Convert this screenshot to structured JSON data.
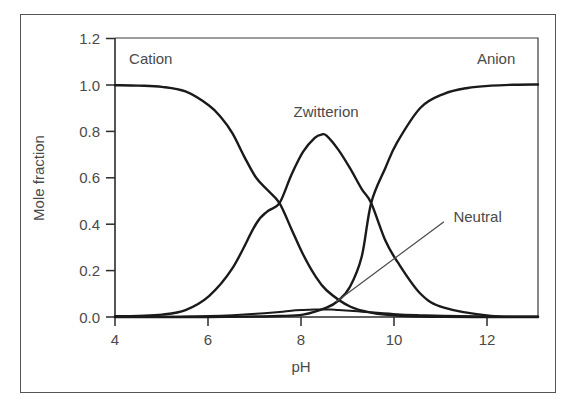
{
  "figure": {
    "background_color": "#ffffff",
    "border_color": "#555555",
    "curve_color": "#1a1a1a",
    "text_color": "#4a4a4a"
  },
  "chart_data": {
    "type": "line",
    "title": "",
    "xlabel": "pH",
    "ylabel": "Mole fraction",
    "xlim": [
      4,
      13
    ],
    "ylim": [
      0.0,
      1.2
    ],
    "xticks": [
      4,
      6,
      8,
      10,
      12
    ],
    "xtick_labels": [
      "4",
      "6",
      "8",
      "10",
      "12"
    ],
    "yticks": [
      0.0,
      0.2,
      0.4,
      0.6,
      0.8,
      1.0,
      1.2
    ],
    "ytick_labels": [
      "0.0",
      "0.2",
      "0.4",
      "0.6",
      "0.8",
      "1.0",
      "1.2"
    ],
    "grid": false,
    "legend": "inline-annotations",
    "annotations": [
      {
        "text": "Cation",
        "x": 4.3,
        "y": 1.09
      },
      {
        "text": "Zwitterion",
        "x": 7.8,
        "y": 0.86
      },
      {
        "text": "Anion",
        "x": 11.7,
        "y": 1.09
      },
      {
        "text": "Neutral",
        "x": 11.2,
        "y": 0.41,
        "leader_from": [
          8.7,
          0.065
        ],
        "leader_to": [
          11.0,
          0.41
        ]
      }
    ],
    "series": [
      {
        "name": "Cation",
        "x": [
          4.0,
          4.5,
          5.0,
          5.5,
          6.0,
          6.25,
          6.5,
          6.75,
          7.0,
          7.25,
          7.5,
          7.75,
          8.0,
          8.25,
          8.5,
          9.0,
          9.5,
          10.0,
          10.5,
          11.0,
          12.0,
          13.0
        ],
        "values": [
          0.997,
          0.995,
          0.99,
          0.97,
          0.91,
          0.86,
          0.79,
          0.69,
          0.6,
          0.545,
          0.49,
          0.38,
          0.27,
          0.18,
          0.115,
          0.045,
          0.017,
          0.006,
          0.002,
          0.001,
          0.0,
          0.0
        ]
      },
      {
        "name": "Zwitterion",
        "x": [
          4.0,
          4.5,
          5.0,
          5.5,
          6.0,
          6.5,
          7.0,
          7.25,
          7.5,
          7.75,
          8.0,
          8.25,
          8.4,
          8.5,
          8.75,
          9.0,
          9.25,
          9.45,
          9.75,
          10.0,
          10.5,
          11.0,
          12.0,
          13.0
        ],
        "values": [
          0.003,
          0.005,
          0.01,
          0.03,
          0.09,
          0.21,
          0.4,
          0.455,
          0.49,
          0.61,
          0.71,
          0.77,
          0.785,
          0.78,
          0.72,
          0.64,
          0.55,
          0.49,
          0.33,
          0.24,
          0.1,
          0.04,
          0.005,
          0.001
        ]
      },
      {
        "name": "Anion",
        "x": [
          4.0,
          5.0,
          6.0,
          7.0,
          7.5,
          8.0,
          8.5,
          8.75,
          9.0,
          9.25,
          9.45,
          9.75,
          10.0,
          10.5,
          11.0,
          11.5,
          12.0,
          12.5,
          13.0
        ],
        "values": [
          0.0,
          0.0,
          0.0,
          0.002,
          0.004,
          0.01,
          0.04,
          0.07,
          0.13,
          0.26,
          0.49,
          0.64,
          0.75,
          0.9,
          0.96,
          0.985,
          0.995,
          0.999,
          1.0
        ]
      },
      {
        "name": "Neutral",
        "x": [
          4.0,
          5.0,
          5.5,
          6.0,
          6.5,
          7.0,
          7.5,
          7.75,
          8.0,
          8.25,
          8.45,
          8.6,
          8.75,
          9.0,
          9.25,
          9.5,
          10.0,
          10.5,
          11.0,
          12.0,
          13.0
        ],
        "values": [
          0.0,
          0.001,
          0.002,
          0.004,
          0.008,
          0.014,
          0.022,
          0.027,
          0.03,
          0.032,
          0.0325,
          0.032,
          0.03,
          0.027,
          0.023,
          0.019,
          0.012,
          0.008,
          0.005,
          0.002,
          0.001
        ]
      }
    ]
  }
}
